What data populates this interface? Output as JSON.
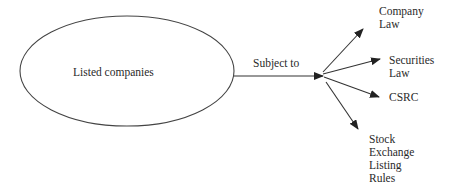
{
  "diagram": {
    "source": {
      "label": "Listed companies"
    },
    "connector": {
      "label": "Subject to"
    },
    "targets": [
      {
        "lines": [
          "Company",
          "Law"
        ]
      },
      {
        "lines": [
          "Securities",
          "Law"
        ]
      },
      {
        "lines": [
          "CSRC"
        ]
      },
      {
        "lines": [
          "Stock",
          "Exchange",
          "Listing",
          "Rules"
        ]
      }
    ],
    "colors": {
      "stroke": "#333333",
      "text": "#2a2a2a",
      "background": "#ffffff"
    }
  }
}
